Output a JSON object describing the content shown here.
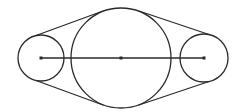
{
  "diagram": {
    "type": "belt-pulley-system",
    "stroke_color": "#2a2a2a",
    "background": "#ffffff",
    "pulleys": [
      {
        "name": "left-pulley",
        "cx": 41,
        "cy": 58,
        "r": 23
      },
      {
        "name": "center-pulley",
        "cx": 121,
        "cy": 58,
        "r": 50
      },
      {
        "name": "right-pulley",
        "cx": 204,
        "cy": 58,
        "r": 24
      }
    ],
    "belt_segments": [
      {
        "name": "belt-upper-left",
        "x1": 36,
        "y1": 35.5,
        "x2": 103,
        "y2": 11
      },
      {
        "name": "belt-lower-left",
        "x1": 36,
        "y1": 80.5,
        "x2": 103,
        "y2": 105
      },
      {
        "name": "belt-upper-right",
        "x1": 139,
        "y1": 11,
        "x2": 209,
        "y2": 34.5
      },
      {
        "name": "belt-lower-right",
        "x1": 139,
        "y1": 105,
        "x2": 209,
        "y2": 81.5
      }
    ],
    "center_line": {
      "x1": 41,
      "y1": 58,
      "x2": 204,
      "y2": 58
    },
    "center_markers": [
      {
        "x": 41,
        "y": 58
      },
      {
        "x": 121,
        "y": 58
      },
      {
        "x": 204,
        "y": 58
      }
    ]
  }
}
